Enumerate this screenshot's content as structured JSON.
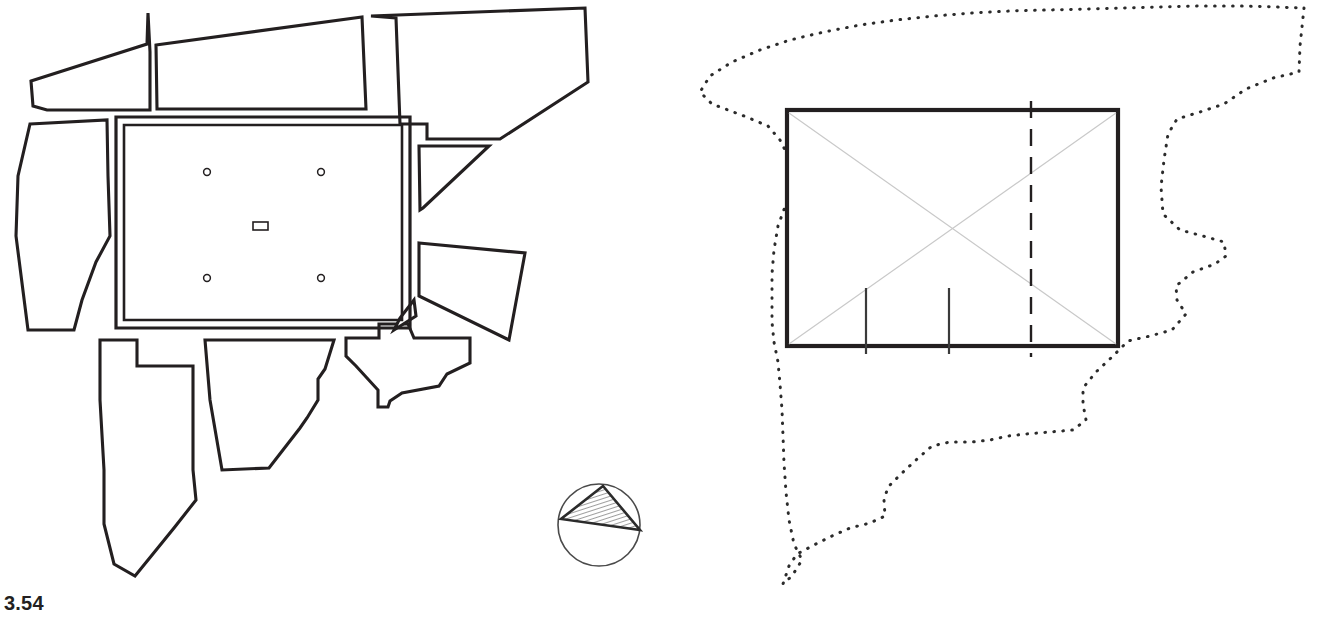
{
  "figure": {
    "panels": [
      {
        "id": "fig-3-54",
        "caption": "3.54",
        "description": "Site plan with central rectangular courtyard surrounded by irregular block outlines and a north-arrow symbol"
      },
      {
        "id": "fig-3-55",
        "caption": "3.55",
        "description": "Schematic rectangle with diagonals inside a dotted irregular site boundary"
      }
    ]
  },
  "left_plan": {
    "caption": "3.54",
    "north_arrow": {
      "name": "north-arrow",
      "circle": {
        "cx": 599,
        "cy": 525,
        "r": 41
      },
      "triangle": [
        [
          603,
          486
        ],
        [
          640,
          530
        ],
        [
          561,
          519
        ]
      ]
    },
    "courtyard": {
      "outer": [
        [
          116,
          117
        ],
        [
          410,
          117
        ],
        [
          410,
          328
        ],
        [
          116,
          328
        ]
      ],
      "inner": [
        [
          124,
          125
        ],
        [
          402,
          125
        ],
        [
          402,
          320
        ],
        [
          124,
          320
        ]
      ],
      "markers": [
        {
          "cx": 207,
          "cy": 172,
          "r": 3.4
        },
        {
          "cx": 321,
          "cy": 172,
          "r": 3.4
        },
        {
          "cx": 207,
          "cy": 278,
          "r": 3.4
        },
        {
          "cx": 321,
          "cy": 278,
          "r": 3.4
        }
      ],
      "base_stone": {
        "x": 253,
        "y": 222,
        "w": 15,
        "h": 8
      }
    },
    "blocks": [
      {
        "name": "block-north-west-wing",
        "points": [
          [
            31,
            81
          ],
          [
            147,
            44
          ],
          [
            148,
            13
          ],
          [
            150,
            52
          ],
          [
            150,
            110
          ],
          [
            47,
            110
          ],
          [
            33,
            106
          ]
        ]
      },
      {
        "name": "block-north-centre",
        "points": [
          [
            156,
            45
          ],
          [
            362,
            17
          ],
          [
            366,
            109
          ],
          [
            157,
            109
          ]
        ]
      },
      {
        "name": "block-north-east",
        "points": [
          [
            371,
            16
          ],
          [
            585,
            8
          ],
          [
            588,
            82
          ],
          [
            500,
            139
          ],
          [
            427,
            139
          ],
          [
            427,
            124
          ],
          [
            400,
            124
          ],
          [
            396,
            18
          ]
        ]
      },
      {
        "name": "block-west-upper",
        "points": [
          [
            30,
            124
          ],
          [
            107,
            120
          ],
          [
            108,
            176
          ],
          [
            110,
            236
          ],
          [
            96,
            262
          ],
          [
            82,
            300
          ],
          [
            74,
            330
          ],
          [
            28,
            330
          ],
          [
            16,
            236
          ],
          [
            18,
            176
          ]
        ]
      },
      {
        "name": "block-east-upper",
        "points": [
          [
            419,
            146
          ],
          [
            489,
            146
          ],
          [
            423,
            208
          ],
          [
            420,
            210
          ]
        ]
      },
      {
        "name": "block-east-lower",
        "points": [
          [
            419,
            243
          ],
          [
            525,
            253
          ],
          [
            509,
            340
          ],
          [
            419,
            296
          ]
        ]
      },
      {
        "name": "block-south-west-tail",
        "points": [
          [
            100,
            340
          ],
          [
            137,
            340
          ],
          [
            137,
            366
          ],
          [
            193,
            366
          ],
          [
            193,
            470
          ],
          [
            196,
            500
          ],
          [
            174,
            528
          ],
          [
            135,
            576
          ],
          [
            114,
            564
          ],
          [
            104,
            524
          ],
          [
            104,
            470
          ],
          [
            100,
            400
          ]
        ]
      },
      {
        "name": "block-south-centre",
        "points": [
          [
            205,
            340
          ],
          [
            334,
            340
          ],
          [
            325,
            369
          ],
          [
            318,
            379
          ],
          [
            318,
            400
          ],
          [
            307,
            418
          ],
          [
            300,
            428
          ],
          [
            269,
            468
          ],
          [
            222,
            470
          ],
          [
            210,
            400
          ]
        ]
      },
      {
        "name": "block-south-east-strip",
        "points": [
          [
            346,
            338
          ],
          [
            379,
            338
          ],
          [
            379,
            324
          ],
          [
            408,
            324
          ],
          [
            414,
            338
          ],
          [
            470,
            338
          ],
          [
            470,
            363
          ],
          [
            447,
            374
          ],
          [
            439,
            386
          ],
          [
            402,
            393
          ],
          [
            390,
            401
          ],
          [
            388,
            407
          ],
          [
            378,
            407
          ],
          [
            378,
            390
          ],
          [
            356,
            366
          ],
          [
            346,
            356
          ]
        ]
      },
      {
        "name": "block-east-small-wedge",
        "points": [
          [
            394,
            330
          ],
          [
            416,
            316
          ],
          [
            414,
            300
          ],
          [
            400,
            318
          ]
        ]
      }
    ],
    "courtyard_connectors": [
      {
        "name": "connector-north-gap",
        "points": [
          [
            110,
            117
          ],
          [
            116,
            117
          ]
        ]
      }
    ]
  },
  "right_plan": {
    "caption": "3.55",
    "building_rect": {
      "x": 787,
      "y": 110,
      "w": 331,
      "h": 236
    },
    "diagonals": [
      [
        [
          789,
          113
        ],
        [
          1116,
          344
        ]
      ],
      [
        [
          1116,
          113
        ],
        [
          789,
          344
        ]
      ]
    ],
    "dashed_line": {
      "x": 1031,
      "y1": 101,
      "y2": 357
    },
    "bottom_ticks": [
      {
        "x": 866,
        "y1": 288,
        "y2": 354
      },
      {
        "x": 949,
        "y1": 288,
        "y2": 354
      }
    ],
    "boundary_points": [
      [
        1304,
        8
      ],
      [
        1300,
        46
      ],
      [
        1299,
        72
      ],
      [
        1273,
        78
      ],
      [
        1246,
        89
      ],
      [
        1224,
        104
      ],
      [
        1200,
        112
      ],
      [
        1177,
        119
      ],
      [
        1168,
        134
      ],
      [
        1164,
        160
      ],
      [
        1161,
        187
      ],
      [
        1163,
        214
      ],
      [
        1180,
        230
      ],
      [
        1203,
        236
      ],
      [
        1224,
        242
      ],
      [
        1226,
        256
      ],
      [
        1215,
        264
      ],
      [
        1193,
        272
      ],
      [
        1176,
        286
      ],
      [
        1177,
        300
      ],
      [
        1186,
        314
      ],
      [
        1172,
        330
      ],
      [
        1150,
        336
      ],
      [
        1128,
        341
      ],
      [
        1112,
        357
      ],
      [
        1096,
        372
      ],
      [
        1083,
        388
      ],
      [
        1083,
        404
      ],
      [
        1086,
        420
      ],
      [
        1073,
        430
      ],
      [
        1050,
        432
      ],
      [
        1026,
        434
      ],
      [
        1008,
        436
      ],
      [
        990,
        440
      ],
      [
        972,
        442
      ],
      [
        950,
        442
      ],
      [
        932,
        446
      ],
      [
        916,
        460
      ],
      [
        901,
        474
      ],
      [
        888,
        487
      ],
      [
        884,
        500
      ],
      [
        885,
        516
      ],
      [
        870,
        523
      ],
      [
        850,
        528
      ],
      [
        832,
        536
      ],
      [
        814,
        545
      ],
      [
        797,
        554
      ],
      [
        789,
        566
      ],
      [
        785,
        578
      ],
      [
        783,
        584
      ],
      [
        792,
        576
      ],
      [
        802,
        560
      ],
      [
        794,
        544
      ],
      [
        789,
        520
      ],
      [
        786,
        492
      ],
      [
        784,
        463
      ],
      [
        783,
        436
      ],
      [
        782,
        410
      ],
      [
        780,
        384
      ],
      [
        778,
        362
      ],
      [
        774,
        342
      ],
      [
        772,
        322
      ],
      [
        772,
        298
      ],
      [
        772,
        274
      ],
      [
        774,
        250
      ],
      [
        778,
        226
      ],
      [
        786,
        204
      ],
      [
        790,
        180
      ],
      [
        788,
        156
      ],
      [
        780,
        140
      ],
      [
        768,
        126
      ],
      [
        744,
        116
      ],
      [
        712,
        104
      ],
      [
        700,
        92
      ],
      [
        710,
        76
      ],
      [
        732,
        62
      ],
      [
        760,
        50
      ],
      [
        790,
        40
      ],
      [
        824,
        32
      ],
      [
        860,
        25
      ],
      [
        896,
        20
      ],
      [
        934,
        16
      ],
      [
        972,
        13
      ],
      [
        1010,
        11
      ],
      [
        1048,
        10
      ],
      [
        1086,
        9
      ],
      [
        1124,
        8
      ],
      [
        1162,
        7
      ],
      [
        1200,
        6
      ],
      [
        1238,
        6
      ],
      [
        1276,
        7
      ],
      [
        1304,
        8
      ]
    ]
  }
}
